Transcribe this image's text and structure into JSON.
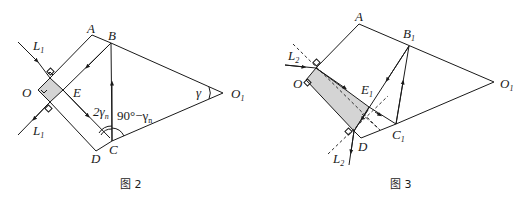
{
  "figure2": {
    "caption": "图 2",
    "labels": {
      "A": "A",
      "B": "B",
      "C": "C",
      "D": "D",
      "E": "E",
      "O": "O",
      "O1": "O",
      "O1_sub": "1",
      "L1_top": "L",
      "L1_top_sub": "1",
      "L1_bottom": "L",
      "L1_bottom_sub": "1",
      "angle_2gamma": "2γ",
      "angle_2gamma_sub": "n",
      "angle_90": "90°−γ",
      "angle_90_sub": "n",
      "gamma": "γ"
    }
  },
  "figure3": {
    "caption": "图 3",
    "labels": {
      "A": "A",
      "B1": "B",
      "B1_sub": "1",
      "C1": "C",
      "C1_sub": "1",
      "D": "D",
      "E1": "E",
      "E1_sub": "1",
      "O": "O",
      "O1": "O",
      "O1_sub": "1",
      "L2_top": "L",
      "L2_top_sub": "2",
      "L2_bottom": "L",
      "L2_bottom_sub": "2"
    }
  },
  "colors": {
    "line": "#1a1a1a",
    "shade": "#d4d4d4",
    "background": "#ffffff"
  }
}
